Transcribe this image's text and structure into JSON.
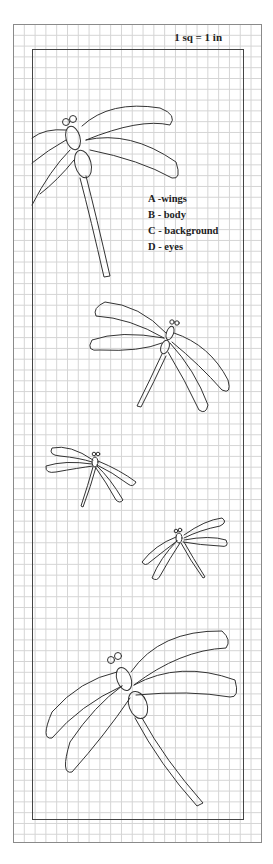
{
  "scale_label": "1 sq = 1 in",
  "legend": {
    "items": [
      {
        "label": "A -wings"
      },
      {
        "label": "B - body"
      },
      {
        "label": "C - background"
      },
      {
        "label": "D - eyes"
      }
    ]
  },
  "colors": {
    "line": "#333333",
    "grid": "#d4d4d4",
    "frame": "#444444"
  },
  "figures": [
    "dragonfly-large-top",
    "dragonfly-medium",
    "dragonfly-small-left",
    "dragonfly-small-right",
    "dragonfly-large-bottom"
  ]
}
